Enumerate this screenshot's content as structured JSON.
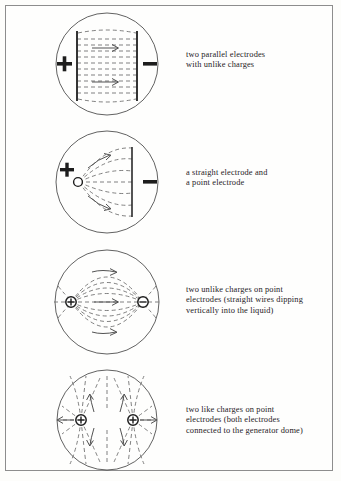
{
  "figure": {
    "background_color": "#fefefd",
    "frame_color": "#8d8d8d",
    "ink_color": "#25211d",
    "field_line_color": "#5d5d5d",
    "panel_count": 4
  },
  "panels": [
    {
      "id": "panel-parallel-electrodes",
      "caption_lines": [
        "two parallel electrodes",
        "with unlike charges"
      ],
      "caption_text": "two parallel electrodes with unlike charges",
      "left_charge_symbol": "+",
      "right_charge_symbol": "−",
      "electrode_type_left": "straight plate",
      "electrode_type_right": "straight plate",
      "field_line_style": "dashed horizontal lines",
      "arrow_count": 2,
      "arrow_direction": "left-to-right"
    },
    {
      "id": "panel-point-and-plate",
      "caption_lines": [
        "a straight electrode and",
        "a point electrode"
      ],
      "caption_text": "a straight electrode and a point electrode",
      "left_charge_symbol": "+",
      "right_charge_symbol": "−",
      "electrode_type_left": "point electrode",
      "electrode_type_right": "straight plate",
      "field_line_style": "dashed curves fanning from point to plate",
      "arrow_count": 2,
      "arrow_direction": "point-to-plate"
    },
    {
      "id": "panel-unlike-point-charges",
      "caption_lines": [
        "two unlike charges on point",
        "electrodes (straight wires dipping",
        "vertically into the liquid)"
      ],
      "caption_text": "two unlike charges on point electrodes (straight wires dipping vertically into the liquid)",
      "left_charge_symbol": "⊕",
      "right_charge_symbol": "⊖",
      "electrode_type_left": "point electrode",
      "electrode_type_right": "point electrode",
      "field_line_style": "dashed dipole loops",
      "arrow_count": 3,
      "arrow_direction": "plus-to-minus"
    },
    {
      "id": "panel-like-point-charges",
      "caption_lines": [
        "two like charges on point",
        "electrodes (both electrodes",
        "connected to the generator dome)"
      ],
      "caption_text": "two like charges on point electrodes (both electrodes connected to the generator dome)",
      "left_charge_symbol": "⊕",
      "right_charge_symbol": "⊕",
      "electrode_type_left": "point electrode",
      "electrode_type_right": "point electrode",
      "field_line_style": "dashed repelling lines with saddle point between",
      "arrow_count": 6,
      "arrow_direction": "outward from each charge"
    }
  ]
}
